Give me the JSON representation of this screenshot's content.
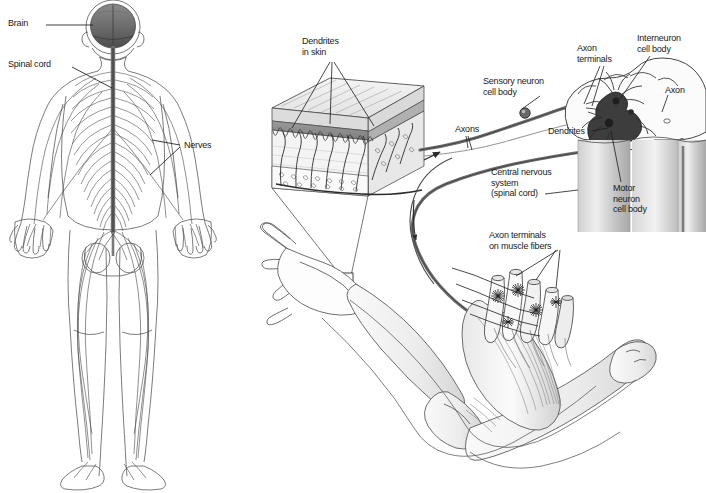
{
  "figure": {
    "background_color": "#ffffff",
    "ink_color": "#2b2b2b",
    "panels": [
      {
        "id": "whole-body",
        "caption": "Human nervous system, posterior view"
      },
      {
        "id": "reflex-arc",
        "caption": "Reflex arc: skin to spinal cord to muscle"
      }
    ]
  },
  "left_panel": {
    "name": "whole-body-nervous-system",
    "labels": [
      {
        "id": "brain",
        "text": "Brain",
        "x": 8,
        "y": 20
      },
      {
        "id": "spinal-cord",
        "text": "Spinal cord",
        "x": 8,
        "y": 60
      },
      {
        "id": "nerves",
        "text": "Nerves",
        "x": 184,
        "y": 141
      }
    ],
    "parts": {
      "brain_shading": "#6e6e6e",
      "body_outline": "#555555",
      "nerve_lines": "#4a4a4a",
      "cord_color": "#777777"
    }
  },
  "right_panel": {
    "name": "reflex-arc-detail",
    "labels": [
      {
        "id": "dendrites-in-skin",
        "text": "Dendrites\nin skin",
        "x": 302,
        "y": 38
      },
      {
        "id": "sensory-neuron-cell-body",
        "text": "Sensory neuron\ncell body",
        "x": 486,
        "y": 78
      },
      {
        "id": "axon-terminals",
        "text": "Axon\nterminals",
        "x": 576,
        "y": 45
      },
      {
        "id": "interneuron-cell-body",
        "text": "Interneuron\ncell body",
        "x": 637,
        "y": 35
      },
      {
        "id": "axon",
        "text": "Axon",
        "x": 664,
        "y": 87
      },
      {
        "id": "axons",
        "text": "Axons",
        "x": 455,
        "y": 126
      },
      {
        "id": "dendrites",
        "text": "Dendrites",
        "x": 549,
        "y": 128
      },
      {
        "id": "central-nervous-system",
        "text": "Central nervous\nsystem\n(spinal cord)",
        "x": 491,
        "y": 170
      },
      {
        "id": "motor-neuron-cell-body",
        "text": "Motor\nneuron\ncell body",
        "x": 613,
        "y": 185
      },
      {
        "id": "axon-terminals-on-muscle-fibers",
        "text": "Axon terminals\non muscle fibers",
        "x": 490,
        "y": 232
      }
    ],
    "components": {
      "skin_block": "layered epidermis and dermis with sensory dendrites",
      "spinal_cord_cross_section": "butterfly gray matter with interneuron and motor neuron",
      "spinal_cord_column": "vertical cord shaft",
      "arm": "flexed arm with bones, biceps muscle and hand",
      "muscle_fibers": "bundle of muscle fibers with axon terminal starbursts",
      "callout_box": "small square on hand marking skin sample"
    },
    "colors": {
      "axon_bundle": "#6b6b6b",
      "gray_matter": "#3a3a3a",
      "skin_upper_layer": "#8d8d8d",
      "cord_shading": "#b5b5b5"
    }
  }
}
